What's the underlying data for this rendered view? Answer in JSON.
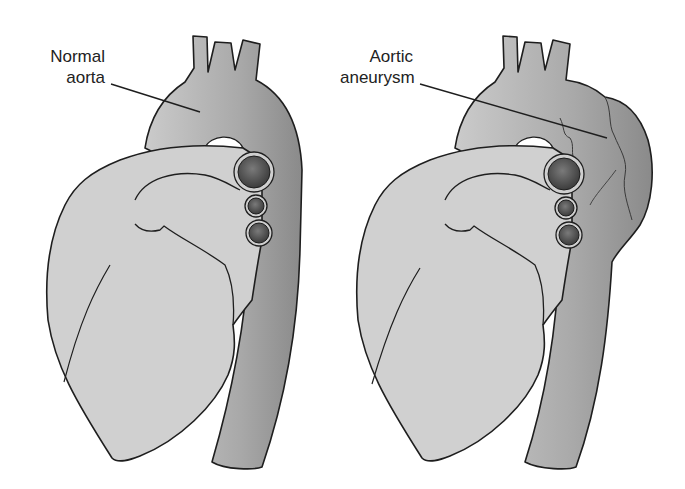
{
  "figure": {
    "panels": [
      {
        "id": "normal",
        "label_lines": [
          "Normal",
          "aorta"
        ]
      },
      {
        "id": "aneurysm",
        "label_lines": [
          "Aortic",
          "aneurysm"
        ]
      }
    ]
  },
  "colors": {
    "background": "#ffffff",
    "heart_fill": "#cfcfcf",
    "aorta_fill_light": "#c2c2c2",
    "aorta_fill_dark": "#8e8e8e",
    "vessel_dark": "#5a5a5a",
    "outline": "#1e1e1e"
  }
}
